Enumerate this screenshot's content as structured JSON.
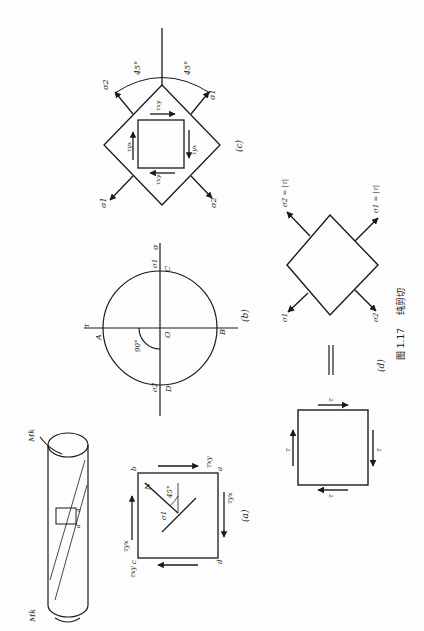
{
  "figure": {
    "number": "图 1.17",
    "title": "纯剪切",
    "orientation": "rotated 90° counter-clockwise (text reads bottom-to-top)"
  },
  "panels": {
    "a": {
      "label": "(a)",
      "corners": [
        "a",
        "b",
        "c",
        "d"
      ],
      "shear_labels": [
        "τxy",
        "τyx",
        "τxy",
        "τyx"
      ],
      "normal_label": "N",
      "stress_label": "σ1",
      "angle": "45°"
    },
    "b": {
      "label": "(b)",
      "axis_sigma": "σ",
      "axis_tau": "τ",
      "points": [
        "A",
        "B",
        "C",
        "D",
        "O"
      ],
      "sigma1": "σ1",
      "sigma2": "σ2",
      "angle": "90°"
    },
    "c": {
      "label": "(c)",
      "angles": [
        "45°",
        "45°"
      ],
      "sigma_labels": [
        "σ1",
        "σ2",
        "σ1",
        "σ2"
      ],
      "shear_labels": [
        "τxy",
        "τyx",
        "τxy",
        "τyx"
      ]
    },
    "d": {
      "label": "(d)",
      "equals": "=",
      "square_tau_labels": [
        "τ",
        "τ",
        "τ",
        "τ"
      ],
      "sigma2_label": "σ2 = |τ|",
      "sigma1_label": "σ1 = |τ|",
      "sigma1_short": "σ1",
      "sigma2_short": "σ2"
    },
    "cylinder": {
      "torque_top": "Mk",
      "torque_bottom": "Mk",
      "corner_labels": [
        "a",
        "b",
        "c",
        "d"
      ]
    }
  }
}
